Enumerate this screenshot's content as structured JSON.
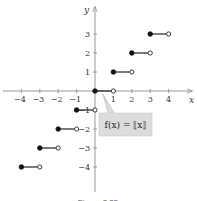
{
  "chart_data": {
    "type": "line",
    "title": "",
    "function_label": "f(x) = [[x]]",
    "xlabel": "x",
    "ylabel": "y",
    "xlim": [
      -4.3,
      5.2
    ],
    "ylim": [
      -5.2,
      4.5
    ],
    "grid": false,
    "x_ticks": [
      -4,
      -3,
      -2,
      -1,
      1,
      2,
      3,
      4
    ],
    "x_tick_labels": [
      "−4",
      "−3",
      "−2",
      "−1",
      "1",
      "2",
      "3",
      "4"
    ],
    "y_ticks": [
      3,
      2,
      1,
      -1,
      -2,
      -3,
      -4
    ],
    "y_tick_labels": [
      "3",
      "2",
      "1",
      "−1",
      "−2",
      "−3",
      "−4"
    ],
    "series": [
      {
        "name": "greatest integer function (step)",
        "segments": [
          {
            "x_start": -4,
            "x_end": -3,
            "y": -4,
            "start_closed": true,
            "end_closed": false
          },
          {
            "x_start": -3,
            "x_end": -2,
            "y": -3,
            "start_closed": true,
            "end_closed": false
          },
          {
            "x_start": -2,
            "x_end": -1,
            "y": -2,
            "start_closed": true,
            "end_closed": false
          },
          {
            "x_start": -1,
            "x_end": 0,
            "y": -1,
            "start_closed": true,
            "end_closed": false
          },
          {
            "x_start": 0,
            "x_end": 1,
            "y": 0,
            "start_closed": true,
            "end_closed": false
          },
          {
            "x_start": 1,
            "x_end": 2,
            "y": 1,
            "start_closed": true,
            "end_closed": false
          },
          {
            "x_start": 2,
            "x_end": 3,
            "y": 2,
            "start_closed": true,
            "end_closed": false
          },
          {
            "x_start": 3,
            "x_end": 4,
            "y": 3,
            "start_closed": true,
            "end_closed": false
          }
        ]
      }
    ],
    "annotations": [
      {
        "text": "f(x) = [[x]]",
        "style": "callout box pointing to step at y=0"
      }
    ]
  },
  "labels": {
    "x_axis": "x",
    "y_axis": "y",
    "callout": "f(x) = ⟦x⟧",
    "caption": "Figure 2.35"
  },
  "colors": {
    "axis": "#8a8a8a",
    "step": "#111111",
    "callout_fill": "#dcdcdc",
    "callout_stroke": "#b5b5b5"
  }
}
